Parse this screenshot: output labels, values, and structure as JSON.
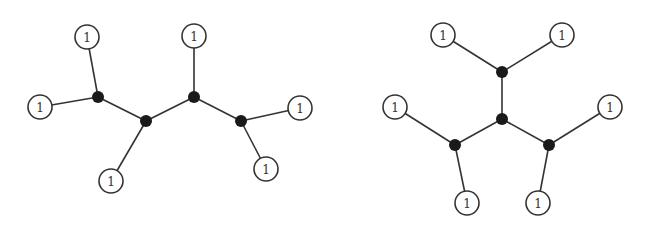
{
  "diagrams": [
    {
      "name": "left-tree",
      "leaf_label": "1",
      "internal_nodes": [
        [
          98,
          97
        ],
        [
          146,
          121
        ],
        [
          194,
          97
        ],
        [
          241,
          121
        ]
      ],
      "leaves": [
        {
          "pos": [
            87,
            37
          ],
          "label": "1",
          "parent": 0
        },
        {
          "pos": [
            40,
            107
          ],
          "label": "1",
          "parent": 0
        },
        {
          "pos": [
            111,
            181
          ],
          "label": "1",
          "parent": 1
        },
        {
          "pos": [
            194,
            36
          ],
          "label": "1",
          "parent": 2
        },
        {
          "pos": [
            300,
            108
          ],
          "label": "1",
          "parent": 3
        },
        {
          "pos": [
            266,
            169
          ],
          "label": "1",
          "parent": 3
        }
      ],
      "internal_edges": [
        [
          0,
          1
        ],
        [
          1,
          2
        ],
        [
          2,
          3
        ]
      ]
    },
    {
      "name": "right-tree",
      "leaf_label": "1",
      "internal_nodes": [
        [
          502,
          72
        ],
        [
          502,
          119
        ],
        [
          455,
          145
        ],
        [
          549,
          145
        ]
      ],
      "leaves": [
        {
          "pos": [
            443,
            35
          ],
          "label": "1",
          "parent": 0
        },
        {
          "pos": [
            562,
            35
          ],
          "label": "1",
          "parent": 0
        },
        {
          "pos": [
            395,
            107
          ],
          "label": "1",
          "parent": 2
        },
        {
          "pos": [
            610,
            107
          ],
          "label": "1",
          "parent": 3
        },
        {
          "pos": [
            467,
            203
          ],
          "label": "1",
          "parent": 2
        },
        {
          "pos": [
            538,
            203
          ],
          "label": "1",
          "parent": 3
        }
      ],
      "internal_edges": [
        [
          0,
          1
        ],
        [
          1,
          2
        ],
        [
          1,
          3
        ]
      ]
    }
  ],
  "style": {
    "leaf_radius": 12,
    "internal_radius": 6,
    "stroke": "#333333",
    "fill_internal": "#1a1a1a"
  }
}
